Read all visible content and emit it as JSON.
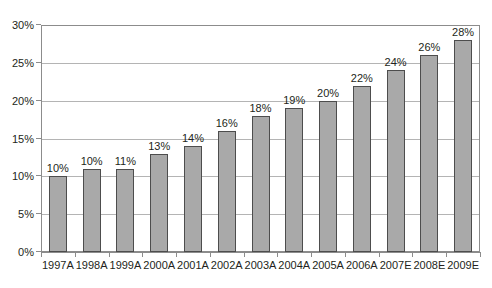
{
  "chart_data": {
    "type": "bar",
    "title": "",
    "subtitle": "",
    "xlabel": "",
    "ylabel": "",
    "categories": [
      "1997A",
      "1998A",
      "1999A",
      "2000A",
      "2001A",
      "2002A",
      "2003A",
      "2004A",
      "2005A",
      "2006A",
      "2007E",
      "2008E",
      "2009E"
    ],
    "values": [
      10,
      11,
      11,
      13,
      14,
      16,
      18,
      19,
      20,
      22,
      24,
      26,
      28
    ],
    "data_labels": [
      "10%",
      "10%",
      "11%",
      "13%",
      "14%",
      "16%",
      "18%",
      "19%",
      "20%",
      "22%",
      "24%",
      "26%",
      "28%"
    ],
    "ylim": [
      0,
      30
    ],
    "ytick_values": [
      0,
      5,
      10,
      15,
      20,
      25,
      30
    ],
    "ytick_labels": [
      "0%",
      "5%",
      "10%",
      "15%",
      "20%",
      "25%",
      "30%"
    ],
    "grid": true,
    "grid_axis": "y",
    "legend": false,
    "legend_position": "none",
    "bar_fill_color": "#a9a9a9",
    "bar_border_color": "#4d4d4d",
    "gridline_color": "#b4b4b4",
    "axis_color": "#8c8c8c",
    "text_color": "#231f20",
    "background_color": "#ffffff"
  }
}
